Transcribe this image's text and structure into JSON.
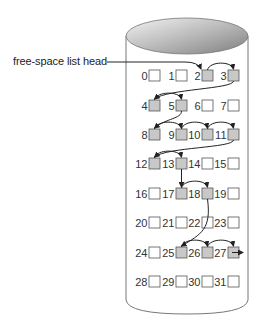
{
  "diagram": {
    "head_label": "free-space list head",
    "colors": {
      "free_block": "#c8c8c8",
      "used_block": "#ffffff",
      "stroke": "#555555",
      "arrow": "#222222",
      "disk_top_light": "#f0f0f0",
      "disk_top_dark": "#8c8c8c"
    },
    "free_blocks": [
      2,
      3,
      4,
      5,
      8,
      9,
      10,
      11,
      12,
      13,
      17,
      18,
      25,
      26,
      27
    ],
    "linked_list": [
      2,
      3,
      4,
      5,
      8,
      9,
      10,
      11,
      12,
      13,
      17,
      18,
      25,
      26,
      27
    ],
    "grid": {
      "rows": 8,
      "cols": 4
    },
    "blocks": [
      {
        "id": 0,
        "label": "0"
      },
      {
        "id": 1,
        "label": "1"
      },
      {
        "id": 2,
        "label": "2"
      },
      {
        "id": 3,
        "label": "3"
      },
      {
        "id": 4,
        "label": "4"
      },
      {
        "id": 5,
        "label": "5"
      },
      {
        "id": 6,
        "label": "6"
      },
      {
        "id": 7,
        "label": "7"
      },
      {
        "id": 8,
        "label": "8"
      },
      {
        "id": 9,
        "label": "9"
      },
      {
        "id": 10,
        "label": "10"
      },
      {
        "id": 11,
        "label": "11"
      },
      {
        "id": 12,
        "label": "12"
      },
      {
        "id": 13,
        "label": "13"
      },
      {
        "id": 14,
        "label": "14"
      },
      {
        "id": 15,
        "label": "15"
      },
      {
        "id": 16,
        "label": "16"
      },
      {
        "id": 17,
        "label": "17"
      },
      {
        "id": 18,
        "label": "18"
      },
      {
        "id": 19,
        "label": "19"
      },
      {
        "id": 20,
        "label": "20"
      },
      {
        "id": 21,
        "label": "21"
      },
      {
        "id": 22,
        "label": "22"
      },
      {
        "id": 23,
        "label": "23"
      },
      {
        "id": 24,
        "label": "24"
      },
      {
        "id": 25,
        "label": "25"
      },
      {
        "id": 26,
        "label": "26"
      },
      {
        "id": 27,
        "label": "27"
      },
      {
        "id": 28,
        "label": "28"
      },
      {
        "id": 29,
        "label": "29"
      },
      {
        "id": 30,
        "label": "30"
      },
      {
        "id": 31,
        "label": "31"
      }
    ]
  }
}
